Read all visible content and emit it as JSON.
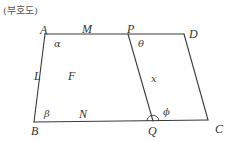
{
  "caption": "(부호도)",
  "points": {
    "A": "A",
    "M": "M",
    "P": "P",
    "D": "D",
    "B": "B",
    "N": "N",
    "Q": "Q",
    "C": "C",
    "L": "L",
    "F": "F"
  },
  "angles": {
    "alpha": "α",
    "theta": "θ",
    "beta": "β",
    "phi": "ϕ"
  },
  "segment_label": "x",
  "edges": [
    {
      "from": "A",
      "to": "D",
      "name": "top-edge-AD"
    },
    {
      "from": "B",
      "to": "C",
      "name": "bottom-edge-BC"
    },
    {
      "from": "A",
      "to": "B",
      "name": "left-edge-AB"
    },
    {
      "from": "D",
      "to": "C",
      "name": "right-edge-DC"
    },
    {
      "from": "P",
      "to": "Q",
      "name": "segment-PQ"
    }
  ]
}
